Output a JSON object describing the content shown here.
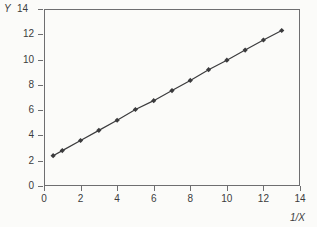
{
  "chart_data": {
    "type": "scatter",
    "title": "",
    "subtitle": "",
    "xlabel": "1/X",
    "ylabel": "Y",
    "xlim": [
      0,
      14
    ],
    "ylim": [
      0,
      14
    ],
    "xticks": [
      0,
      2,
      4,
      6,
      8,
      10,
      12,
      14
    ],
    "yticks": [
      0,
      2,
      4,
      6,
      8,
      10,
      12,
      14
    ],
    "xtick_labels": [
      "0",
      "2",
      "4",
      "6",
      "8",
      "10",
      "12",
      "14"
    ],
    "ytick_labels": [
      "0",
      "2",
      "4",
      "6",
      "8",
      "10",
      "12",
      "14"
    ],
    "grid": false,
    "legend": null,
    "legend_position": "none",
    "marker": "diamond",
    "marker_color": "#3b3b3d",
    "line_color": "#3b3b3d",
    "connected": true,
    "x": [
      0.5,
      1,
      2,
      3,
      4,
      5,
      6,
      7,
      8,
      9,
      10,
      11,
      12,
      13
    ],
    "y": [
      2.4,
      2.8,
      3.6,
      4.4,
      5.2,
      6.05,
      6.75,
      7.55,
      8.35,
      9.2,
      9.95,
      10.75,
      11.55,
      12.3
    ],
    "series": [
      {
        "name": "Y vs 1/X",
        "x": [
          0.5,
          1,
          2,
          3,
          4,
          5,
          6,
          7,
          8,
          9,
          10,
          11,
          12,
          13
        ],
        "values": [
          2.4,
          2.8,
          3.6,
          4.4,
          5.2,
          6.05,
          6.75,
          7.55,
          8.35,
          9.2,
          9.95,
          10.75,
          11.55,
          12.3
        ]
      }
    ],
    "annotations": []
  },
  "axes": {
    "y_name": "Y",
    "y_top_value": "14",
    "x_name": "1/X"
  },
  "colors": {
    "background": "#fbfbf9",
    "frame": "#6e6e70",
    "text": "#3b3b3d",
    "data": "#3b3b3d"
  }
}
